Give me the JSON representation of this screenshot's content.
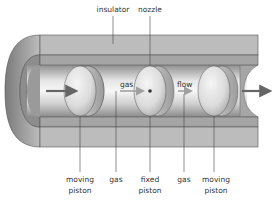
{
  "diagram": {
    "top_labels": {
      "insulator": "insulator",
      "nozzle": "nozzle"
    },
    "inner_labels": {
      "gas": "gas",
      "flow": "flow"
    },
    "bottom_labels": [
      {
        "line1": "moving",
        "line2": "piston"
      },
      {
        "line1": "gas",
        "line2": ""
      },
      {
        "line1": "fixed",
        "line2": "piston"
      },
      {
        "line1": "gas",
        "line2": ""
      },
      {
        "line1": "moving",
        "line2": "piston"
      }
    ],
    "colors": {
      "insulator_outer": "#b9b9b9",
      "insulator_inner": "#a3a3a3",
      "tube_light": "#f2f2f2",
      "tube_dark": "#8a8a8a",
      "arrow": "#666666",
      "leader": "#444444"
    }
  }
}
